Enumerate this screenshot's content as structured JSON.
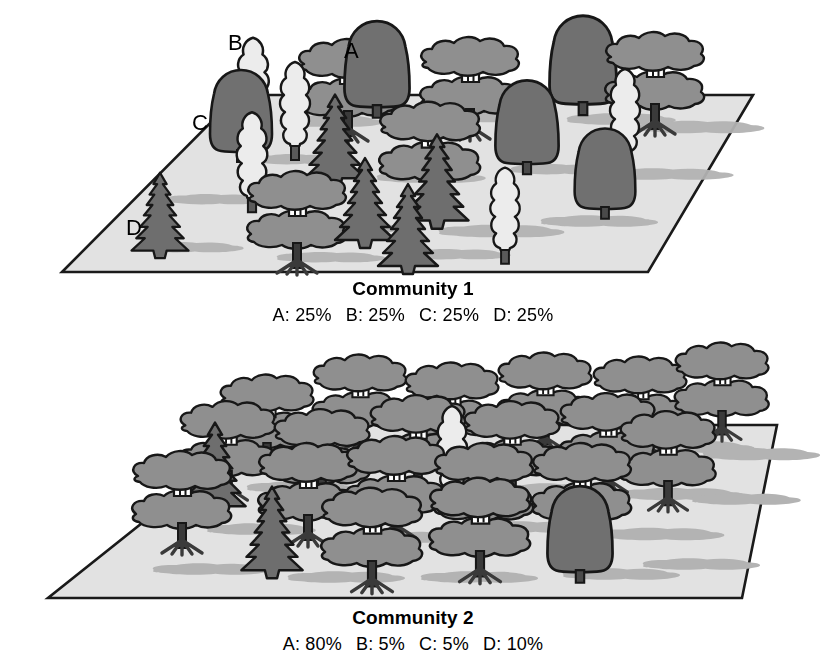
{
  "figure": {
    "background_color": "#ffffff"
  },
  "palette": {
    "ground_fill": "#e2e2e2",
    "ground_stroke": "#1a1a1a",
    "shadow_fill": "#b3b3b3",
    "species_a_fill": "#8f8f8f",
    "species_b_fill": "#ececec",
    "species_c_fill": "#707070",
    "species_d_fill": "#6e6e6e",
    "outline": "#171717",
    "text_color": "#000000"
  },
  "legend": {
    "species_markers": [
      {
        "id": "A",
        "label": "A",
        "x": 350,
        "y": 50,
        "description": "broad layered canopy tree, medium gray"
      },
      {
        "id": "B",
        "label": "B",
        "x": 234,
        "y": 42,
        "description": "columnar poplar tree, light gray"
      },
      {
        "id": "C",
        "label": "C",
        "x": 200,
        "y": 123,
        "description": "rounded dome tree, dark gray"
      },
      {
        "id": "D",
        "label": "D",
        "x": 136,
        "y": 228,
        "description": "conifer tree, dark gray"
      }
    ]
  },
  "panels": [
    {
      "id": "community-1",
      "title": "Community 1",
      "composition_label": "A: 25%   B: 25%   C: 25%   D: 25%",
      "composition": [
        {
          "species": "A",
          "text": "A: 25%",
          "percent": 25
        },
        {
          "species": "B",
          "text": "B: 25%",
          "percent": 25
        },
        {
          "species": "C",
          "text": "C: 25%",
          "percent": 25
        },
        {
          "species": "D",
          "text": "D: 25%",
          "percent": 25
        }
      ],
      "plane": {
        "tl": [
          238,
          95
        ],
        "tr": [
          753,
          95
        ],
        "br": [
          648,
          272
        ],
        "bl": [
          62,
          272
        ]
      },
      "tree_counts": {
        "A": 6,
        "B": 6,
        "C": 6,
        "D": 6,
        "total": 24
      },
      "trees": [
        {
          "type": "A",
          "x": 348,
          "y": 108,
          "scale": 1.0
        },
        {
          "type": "A",
          "x": 470,
          "y": 103,
          "scale": 1.0
        },
        {
          "type": "A",
          "x": 655,
          "y": 96,
          "scale": 1.0
        },
        {
          "type": "A",
          "x": 430,
          "y": 163,
          "scale": 1.05
        },
        {
          "type": "A",
          "x": 297,
          "y": 232,
          "scale": 1.05
        },
        {
          "type": "A",
          "x": 593,
          "y": 118,
          "scale": 0.92
        },
        {
          "type": "B",
          "x": 253,
          "y": 90,
          "scale": 1.05
        },
        {
          "type": "B",
          "x": 293,
          "y": 123,
          "scale": 0.95
        },
        {
          "type": "B",
          "x": 251,
          "y": 178,
          "scale": 1.0
        },
        {
          "type": "B",
          "x": 505,
          "y": 222,
          "scale": 0.95
        },
        {
          "type": "B",
          "x": 625,
          "y": 140,
          "scale": 1.0
        },
        {
          "type": "B",
          "x": 210,
          "y": 150,
          "scale": 0.8
        },
        {
          "type": "C",
          "x": 241,
          "y": 133,
          "scale": 1.0
        },
        {
          "type": "C",
          "x": 377,
          "y": 100,
          "scale": 1.05
        },
        {
          "type": "C",
          "x": 527,
          "y": 138,
          "scale": 1.0
        },
        {
          "type": "C",
          "x": 583,
          "y": 96,
          "scale": 1.05
        },
        {
          "type": "C",
          "x": 603,
          "y": 188,
          "scale": 0.95
        },
        {
          "type": "C",
          "x": 692,
          "y": 112,
          "scale": 0.85
        },
        {
          "type": "D",
          "x": 157,
          "y": 222,
          "scale": 0.95
        },
        {
          "type": "D",
          "x": 333,
          "y": 148,
          "scale": 1.0
        },
        {
          "type": "D",
          "x": 362,
          "y": 205,
          "scale": 1.0
        },
        {
          "type": "D",
          "x": 432,
          "y": 198,
          "scale": 1.05
        },
        {
          "type": "D",
          "x": 405,
          "y": 243,
          "scale": 1.0
        },
        {
          "type": "D",
          "x": 242,
          "y": 198,
          "scale": 0.7
        }
      ]
    },
    {
      "id": "community-2",
      "title": "Community 2",
      "composition_label": "A: 80%   B: 5%   C: 5%   D: 10%",
      "composition": [
        {
          "species": "A",
          "text": "A: 80%",
          "percent": 80
        },
        {
          "species": "B",
          "text": "B: 5%",
          "percent": 5
        },
        {
          "species": "C",
          "text": "C: 5%",
          "percent": 5
        },
        {
          "species": "D",
          "text": "D: 10%",
          "percent": 10
        }
      ],
      "plane": {
        "tl": [
          265,
          425
        ],
        "tr": [
          777,
          425
        ],
        "br": [
          742,
          598
        ],
        "bl": [
          48,
          598
        ]
      },
      "tree_counts": {
        "A": 20,
        "B": 1,
        "C": 1,
        "D": 2,
        "total": 24
      },
      "trees": [
        {
          "type": "A",
          "x": 267,
          "y": 430,
          "scale": 1.0
        },
        {
          "type": "A",
          "x": 355,
          "y": 412,
          "scale": 1.0
        },
        {
          "type": "A",
          "x": 447,
          "y": 418,
          "scale": 1.0
        },
        {
          "type": "A",
          "x": 540,
          "y": 408,
          "scale": 1.0
        },
        {
          "type": "A",
          "x": 637,
          "y": 412,
          "scale": 1.0
        },
        {
          "type": "A",
          "x": 720,
          "y": 398,
          "scale": 1.0
        },
        {
          "type": "A",
          "x": 228,
          "y": 455,
          "scale": 1.0
        },
        {
          "type": "A",
          "x": 320,
          "y": 462,
          "scale": 1.0
        },
        {
          "type": "A",
          "x": 413,
          "y": 450,
          "scale": 1.0
        },
        {
          "type": "A",
          "x": 508,
          "y": 455,
          "scale": 1.0
        },
        {
          "type": "A",
          "x": 603,
          "y": 448,
          "scale": 1.0
        },
        {
          "type": "A",
          "x": 663,
          "y": 462,
          "scale": 1.0
        },
        {
          "type": "A",
          "x": 180,
          "y": 500,
          "scale": 1.0
        },
        {
          "type": "A",
          "x": 305,
          "y": 498,
          "scale": 1.0
        },
        {
          "type": "A",
          "x": 392,
          "y": 490,
          "scale": 1.0
        },
        {
          "type": "A",
          "x": 478,
          "y": 498,
          "scale": 1.0
        },
        {
          "type": "A",
          "x": 272,
          "y": 535,
          "scale": 1.0
        },
        {
          "type": "A",
          "x": 378,
          "y": 540,
          "scale": 1.0
        },
        {
          "type": "A",
          "x": 480,
          "y": 528,
          "scale": 1.0
        },
        {
          "type": "A",
          "x": 578,
          "y": 500,
          "scale": 1.0
        },
        {
          "type": "B",
          "x": 448,
          "y": 465,
          "scale": 1.0
        },
        {
          "type": "C",
          "x": 578,
          "y": 540,
          "scale": 1.1
        },
        {
          "type": "D",
          "x": 212,
          "y": 480,
          "scale": 1.05
        },
        {
          "type": "D",
          "x": 268,
          "y": 540,
          "scale": 1.05
        }
      ]
    }
  ]
}
